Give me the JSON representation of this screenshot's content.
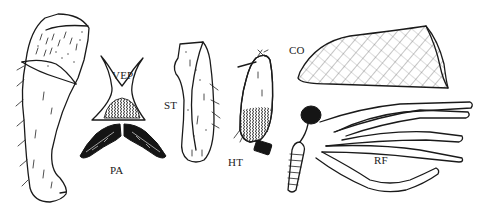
{
  "figure": {
    "background": "#ffffff",
    "ink_color": "#1a1a1a",
    "labels": {
      "vep": "VEP",
      "pa": "PA",
      "st": "ST",
      "ht": "HT",
      "co": "CO",
      "rf": "RF"
    },
    "parts": [
      {
        "id": "leg-segment",
        "label": ""
      },
      {
        "id": "vep",
        "label": "VEP"
      },
      {
        "id": "pa",
        "label": "PA"
      },
      {
        "id": "st",
        "label": "ST"
      },
      {
        "id": "ht",
        "label": "HT"
      },
      {
        "id": "co",
        "label": "CO"
      },
      {
        "id": "rf",
        "label": "RF"
      }
    ]
  }
}
